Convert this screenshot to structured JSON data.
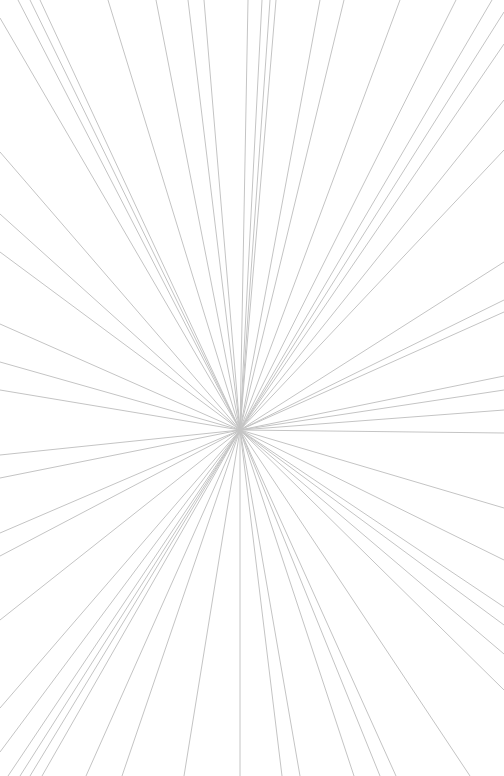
{
  "graphic": {
    "type": "radial-line-burst",
    "width": 504,
    "height": 776,
    "background": "#ffffff",
    "line_color": "#c4c4c4",
    "line_width": 1,
    "center": [
      240,
      430
    ],
    "endpoints": [
      [
        18,
        0
      ],
      [
        30,
        0
      ],
      [
        40,
        0
      ],
      [
        108,
        0
      ],
      [
        156,
        0
      ],
      [
        188,
        0
      ],
      [
        204,
        0
      ],
      [
        248,
        0
      ],
      [
        262,
        0
      ],
      [
        270,
        0
      ],
      [
        276,
        0
      ],
      [
        320,
        0
      ],
      [
        344,
        0
      ],
      [
        400,
        0
      ],
      [
        456,
        0
      ],
      [
        492,
        0
      ],
      [
        504,
        12
      ],
      [
        504,
        44
      ],
      [
        504,
        100
      ],
      [
        504,
        150
      ],
      [
        504,
        262
      ],
      [
        504,
        300
      ],
      [
        504,
        312
      ],
      [
        504,
        376
      ],
      [
        504,
        390
      ],
      [
        504,
        410
      ],
      [
        504,
        433
      ],
      [
        504,
        508
      ],
      [
        504,
        560
      ],
      [
        504,
        607
      ],
      [
        504,
        625
      ],
      [
        504,
        654
      ],
      [
        504,
        690
      ],
      [
        470,
        776
      ],
      [
        396,
        776
      ],
      [
        380,
        776
      ],
      [
        354,
        776
      ],
      [
        300,
        776
      ],
      [
        282,
        776
      ],
      [
        240,
        776
      ],
      [
        184,
        776
      ],
      [
        122,
        776
      ],
      [
        86,
        776
      ],
      [
        42,
        776
      ],
      [
        30,
        776
      ],
      [
        20,
        776
      ],
      [
        8,
        776
      ],
      [
        0,
        752
      ],
      [
        0,
        708
      ],
      [
        0,
        620
      ],
      [
        0,
        556
      ],
      [
        0,
        533
      ],
      [
        0,
        478
      ],
      [
        0,
        455
      ],
      [
        0,
        390
      ],
      [
        0,
        362
      ],
      [
        0,
        324
      ],
      [
        0,
        252
      ],
      [
        0,
        214
      ],
      [
        0,
        152
      ],
      [
        0,
        18
      ]
    ]
  }
}
